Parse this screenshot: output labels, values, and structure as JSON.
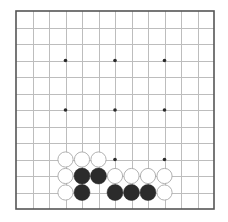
{
  "board": {
    "size": 13,
    "origin_x": 16,
    "origin_y": 11,
    "spacing": 16.5,
    "stone_radius": 8,
    "star_radius": 1.8,
    "colors": {
      "background": "#ffffff",
      "grid_line": "#bdbdbd",
      "border": "#555555",
      "black_stone": "#2b2b2b",
      "white_stone": "#ffffff",
      "white_stone_outline": "#a8a8a8",
      "star_point": "#2b2b2b"
    },
    "star_points": [
      [
        3,
        3
      ],
      [
        6,
        3
      ],
      [
        9,
        3
      ],
      [
        3,
        6
      ],
      [
        6,
        6
      ],
      [
        9,
        6
      ],
      [
        3,
        9
      ],
      [
        6,
        9
      ],
      [
        9,
        9
      ]
    ],
    "stones": [
      {
        "color": "white",
        "col": 3,
        "row": 9
      },
      {
        "color": "white",
        "col": 4,
        "row": 9
      },
      {
        "color": "white",
        "col": 5,
        "row": 9
      },
      {
        "color": "white",
        "col": 3,
        "row": 10
      },
      {
        "color": "black",
        "col": 4,
        "row": 10
      },
      {
        "color": "black",
        "col": 5,
        "row": 10
      },
      {
        "color": "white",
        "col": 6,
        "row": 10
      },
      {
        "color": "white",
        "col": 7,
        "row": 10
      },
      {
        "color": "white",
        "col": 8,
        "row": 10
      },
      {
        "color": "white",
        "col": 9,
        "row": 10
      },
      {
        "color": "white",
        "col": 3,
        "row": 11
      },
      {
        "color": "black",
        "col": 4,
        "row": 11
      },
      {
        "color": "black",
        "col": 6,
        "row": 11
      },
      {
        "color": "black",
        "col": 7,
        "row": 11
      },
      {
        "color": "black",
        "col": 8,
        "row": 11
      },
      {
        "color": "white",
        "col": 9,
        "row": 11
      }
    ]
  }
}
